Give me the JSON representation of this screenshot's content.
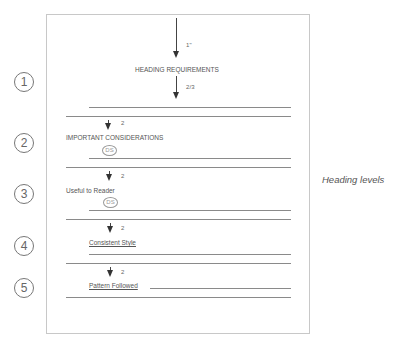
{
  "caption": "Heading levels",
  "top_spacing": {
    "first_label": "1\"",
    "second_label": "2/3"
  },
  "levels": [
    {
      "number": "1",
      "heading": "HEADING REQUIREMENTS"
    },
    {
      "number": "2",
      "heading": "IMPORTANT CONSIDERATIONS",
      "spacing": "2",
      "mark": "DS"
    },
    {
      "number": "3",
      "heading": "Useful to Reader",
      "spacing": "2",
      "mark": "DS"
    },
    {
      "number": "4",
      "heading": "Consistent Style",
      "spacing": "2"
    },
    {
      "number": "5",
      "heading": "Pattern Followed",
      "spacing": "2"
    }
  ],
  "colors": {
    "line": "#8a8a8a",
    "border": "#c8c8c8",
    "arrow": "#333333"
  }
}
